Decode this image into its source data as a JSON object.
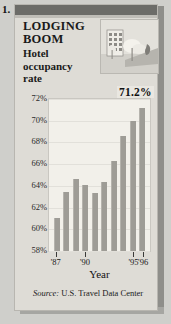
{
  "item_number": "1.",
  "headline": "LODGING BOOM",
  "subhead": "Hotel occupancy rate",
  "callout_value": "71.2%",
  "photo_alt": "hotel-building-photo",
  "source_prefix": "Source:",
  "source_text": "U.S. Travel Data Center",
  "chart_data": {
    "type": "bar",
    "title": "LODGING BOOM",
    "subtitle": "Hotel occupancy rate",
    "xlabel": "Year",
    "ylabel": "",
    "ylim": [
      58,
      72
    ],
    "ytick_labels": [
      "58%",
      "60%",
      "62%",
      "64%",
      "66%",
      "68%",
      "70%",
      "72%"
    ],
    "ytick_values": [
      58,
      60,
      62,
      64,
      66,
      68,
      70,
      72
    ],
    "grid": true,
    "legend": "none",
    "categories": [
      "'87",
      "'88",
      "'89",
      "'90",
      "'91",
      "'92",
      "'93",
      "'94",
      "'95",
      "'96"
    ],
    "xtick_labels": [
      "'87",
      "'90",
      "'95",
      "'96"
    ],
    "xtick_indices": [
      0,
      3,
      8,
      9
    ],
    "values": [
      61.0,
      63.4,
      64.6,
      64.1,
      63.3,
      64.4,
      66.3,
      68.6,
      70.0,
      71.2
    ],
    "annotations": [
      {
        "text": "71.2%",
        "category": "'96",
        "value": 71.2
      }
    ],
    "bar_color": "#9e9c96",
    "plot_background": "#f2f0ea"
  }
}
